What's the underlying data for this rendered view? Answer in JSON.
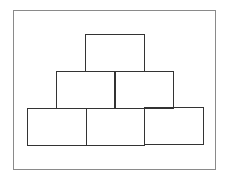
{
  "diagram": {
    "type": "block-pyramid",
    "rows": [
      {
        "level": "top",
        "blocks": 1
      },
      {
        "level": "middle",
        "blocks": 2
      },
      {
        "level": "bottom",
        "blocks": 3
      }
    ],
    "total_blocks": 6,
    "colors": {
      "border": "#333333",
      "frame": "#8a8a8a",
      "background": "#ffffff"
    }
  }
}
